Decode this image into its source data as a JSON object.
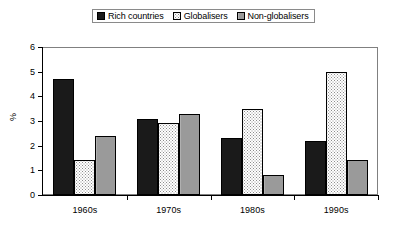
{
  "chart_data": {
    "type": "bar",
    "title": "",
    "xlabel": "",
    "ylabel": "%",
    "ylim": [
      0,
      6
    ],
    "yticks": [
      0,
      1,
      2,
      3,
      4,
      5,
      6
    ],
    "grid": false,
    "legend_position": "top-center",
    "categories": [
      "1960s",
      "1970s",
      "1980s",
      "1990s"
    ],
    "series": [
      {
        "name": "Rich countries",
        "values": [
          4.7,
          3.1,
          2.3,
          2.2
        ],
        "color": "#1a1a1a",
        "pattern": "solid-black"
      },
      {
        "name": "Globalisers",
        "values": [
          1.4,
          2.9,
          3.5,
          5.0
        ],
        "color": "#ffffff",
        "pattern": "dotted-white"
      },
      {
        "name": "Non-globalisers",
        "values": [
          2.4,
          3.3,
          0.8,
          1.4
        ],
        "color": "#9a9a9a",
        "pattern": "solid-gray"
      }
    ]
  },
  "legend": {
    "items": [
      {
        "label": "Rich countries",
        "swatch": "legend-swatch-rich-countries"
      },
      {
        "label": "Globalisers",
        "swatch": "legend-swatch-globalisers"
      },
      {
        "label": "Non-globalisers",
        "swatch": "legend-swatch-non-globalisers"
      }
    ]
  },
  "axes": {
    "y": {
      "title": "%",
      "tick_labels": [
        "6",
        "5",
        "4",
        "3",
        "2",
        "1",
        "0"
      ]
    },
    "x": {
      "tick_labels": [
        "1960s",
        "1970s",
        "1980s",
        "1990s"
      ]
    }
  }
}
